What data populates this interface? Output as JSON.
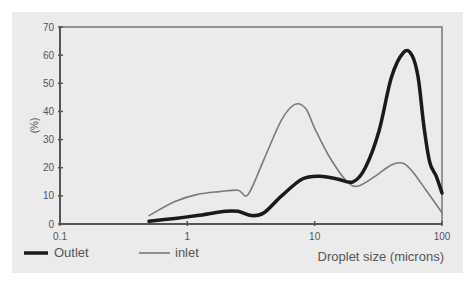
{
  "chart_data": {
    "type": "line",
    "title": "",
    "xlabel": "Droplet size (microns)",
    "ylabel": "(%)",
    "xscale": "log",
    "xlim": [
      0.1,
      100
    ],
    "ylim": [
      0,
      70
    ],
    "xticks": [
      "0.1",
      "1",
      "10",
      "100"
    ],
    "yticks": [
      "0",
      "10",
      "20",
      "30",
      "40",
      "50",
      "60",
      "70"
    ],
    "grid": false,
    "legend_position": "bottom-left",
    "series": [
      {
        "name": "Outlet",
        "style": "thick dark",
        "color": "#1a1a1a",
        "x": [
          0.5,
          0.8,
          1.2,
          2.0,
          2.5,
          3.2,
          4.0,
          5.5,
          8.0,
          11,
          15,
          20,
          25,
          32,
          40,
          50,
          58,
          65,
          72,
          80,
          90,
          100
        ],
        "y": [
          1,
          2,
          3,
          4.5,
          4.5,
          3,
          4,
          10,
          16,
          17,
          16,
          15,
          20,
          33,
          52,
          61,
          60,
          52,
          35,
          22,
          17,
          11
        ]
      },
      {
        "name": "inlet",
        "style": "thin gray",
        "color": "#7a7a7a",
        "x": [
          0.5,
          0.8,
          1.2,
          1.8,
          2.5,
          3.0,
          4.0,
          5.5,
          7.0,
          8.5,
          10,
          13,
          18,
          22,
          30,
          40,
          50,
          60,
          75,
          100
        ],
        "y": [
          3,
          8,
          10.5,
          11.5,
          12,
          10.5,
          23,
          37,
          42.5,
          41,
          34,
          24,
          15,
          13.5,
          17,
          21,
          21.5,
          18,
          12,
          4
        ]
      }
    ]
  },
  "legend": {
    "items": [
      {
        "label": "Outlet"
      },
      {
        "label": "inlet"
      }
    ]
  },
  "axes": {
    "ylabel": "(%)",
    "xlabel": "Droplet size (microns)"
  }
}
